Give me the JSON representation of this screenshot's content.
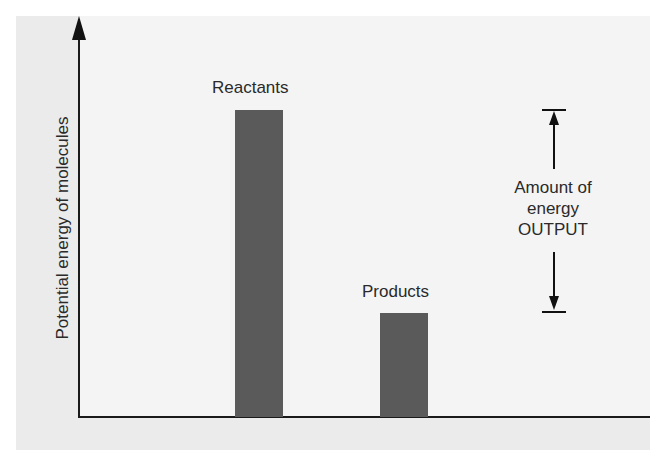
{
  "diagram": {
    "y_axis_label": "Potential energy of molecules",
    "bars": [
      {
        "label": "Reactants",
        "relative_height": 0.88,
        "color": "#5a5a5a"
      },
      {
        "label": "Products",
        "relative_height": 0.34,
        "color": "#5a5a5a"
      }
    ],
    "annotation": {
      "line1": "Amount of",
      "line2": "energy",
      "line3": "OUTPUT"
    },
    "colors": {
      "panel_background": "#ebebeb",
      "plot_background": "#f4f4f4",
      "bar": "#5a5a5a",
      "axis": "#1a1a1a",
      "text": "#2a2a2a"
    }
  }
}
